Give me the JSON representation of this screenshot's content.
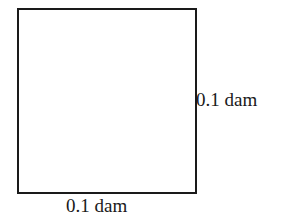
{
  "diagram": {
    "shape": "square",
    "colors": {
      "stroke": "#1a1a1a",
      "fill": "#ffffff",
      "text": "#1a1a1a"
    },
    "labels": {
      "right_side": "0.1 dam",
      "bottom_side": "0.1 dam"
    }
  }
}
